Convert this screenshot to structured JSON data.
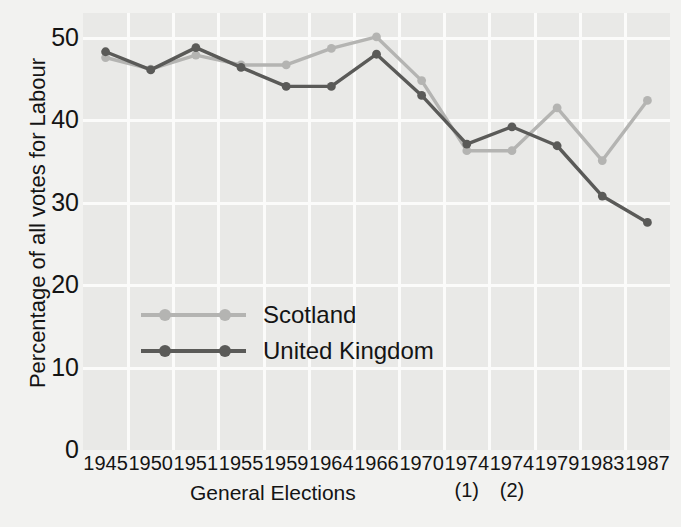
{
  "chart_data": {
    "type": "line",
    "title": "",
    "xlabel": "General Elections",
    "ylabel": "Percentage of all votes for Labour",
    "categories": [
      "1945",
      "1950",
      "1951",
      "1955",
      "1959",
      "1964",
      "1966",
      "1970",
      "1974",
      "1974",
      "1979",
      "1983",
      "1987"
    ],
    "category_notes": [
      "",
      "",
      "",
      "",
      "",
      "",
      "",
      "",
      "(1)",
      "(2)",
      "",
      "",
      ""
    ],
    "ylim": [
      0,
      53
    ],
    "yticks": [
      0,
      10,
      20,
      30,
      40,
      50
    ],
    "ytick_labels": [
      "0",
      "10",
      "20",
      "30",
      "40",
      "50"
    ],
    "grid": true,
    "legend_position": "inside-left-lower",
    "series": [
      {
        "name": "Scotland",
        "color": "#b4b4b2",
        "values": [
          47.6,
          46.2,
          47.9,
          46.7,
          46.7,
          48.7,
          50.1,
          44.8,
          36.3,
          36.3,
          41.5,
          35.1,
          42.4
        ]
      },
      {
        "name": "United Kingdom",
        "color": "#5a5a58",
        "values": [
          48.3,
          46.1,
          48.8,
          46.4,
          44.1,
          44.1,
          48.0,
          43.0,
          37.1,
          39.2,
          36.9,
          30.8,
          27.6
        ]
      }
    ]
  },
  "axis": {
    "y_label": "Percentage of all votes for Labour",
    "x_label": "General Elections"
  },
  "legend": {
    "items": [
      {
        "label": "Scotland",
        "color": "#b4b4b2"
      },
      {
        "label": "United Kingdom",
        "color": "#5a5a58"
      }
    ]
  },
  "ghost_text": {
    "line1": "The Thistle and the",
    "line2": "nent the nationalist",
    "line3": "and hence in the dominance",
    "line4": "Wales and Scotland"
  },
  "colors": {
    "plot_background": "#e9e9e7",
    "page_background": "#f2f2f0",
    "gridline": "#fbfbfa",
    "text": "#141414",
    "scotland": "#b4b4b2",
    "united_kingdom": "#5a5a58"
  }
}
